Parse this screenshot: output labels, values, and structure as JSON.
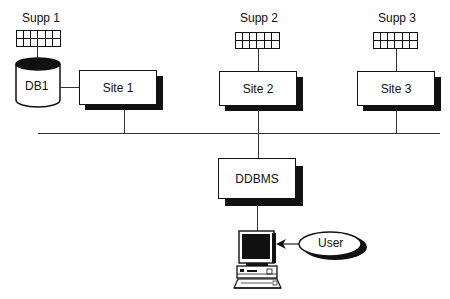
{
  "diagram": {
    "suppliers": [
      {
        "label": "Supp 1"
      },
      {
        "label": "Supp 2"
      },
      {
        "label": "Supp 3"
      }
    ],
    "database": {
      "label": "DB1"
    },
    "sites": [
      {
        "label": "Site 1"
      },
      {
        "label": "Site 2"
      },
      {
        "label": "Site 3"
      }
    ],
    "ddbms": {
      "label": "DDBMS"
    },
    "user": {
      "label": "User"
    },
    "colors": {
      "line": "#333333",
      "shadow": "#111111",
      "background": "#ffffff"
    }
  }
}
